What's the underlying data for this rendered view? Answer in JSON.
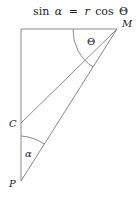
{
  "diagram": {
    "formula": {
      "text": "sin α = r cos Θ",
      "parts": [
        "sin",
        "α",
        "=",
        "r",
        "cos",
        "Θ"
      ]
    },
    "points": {
      "M": {
        "label": "M"
      },
      "C": {
        "label": "C"
      },
      "P": {
        "label": "P"
      }
    },
    "angles": {
      "theta": {
        "label": "Θ",
        "vertex": "M"
      },
      "alpha": {
        "label": "α",
        "vertex": "P"
      }
    },
    "colors": {
      "line": "#8a8a8a",
      "text": "#222222",
      "background": "#ffffff"
    }
  }
}
